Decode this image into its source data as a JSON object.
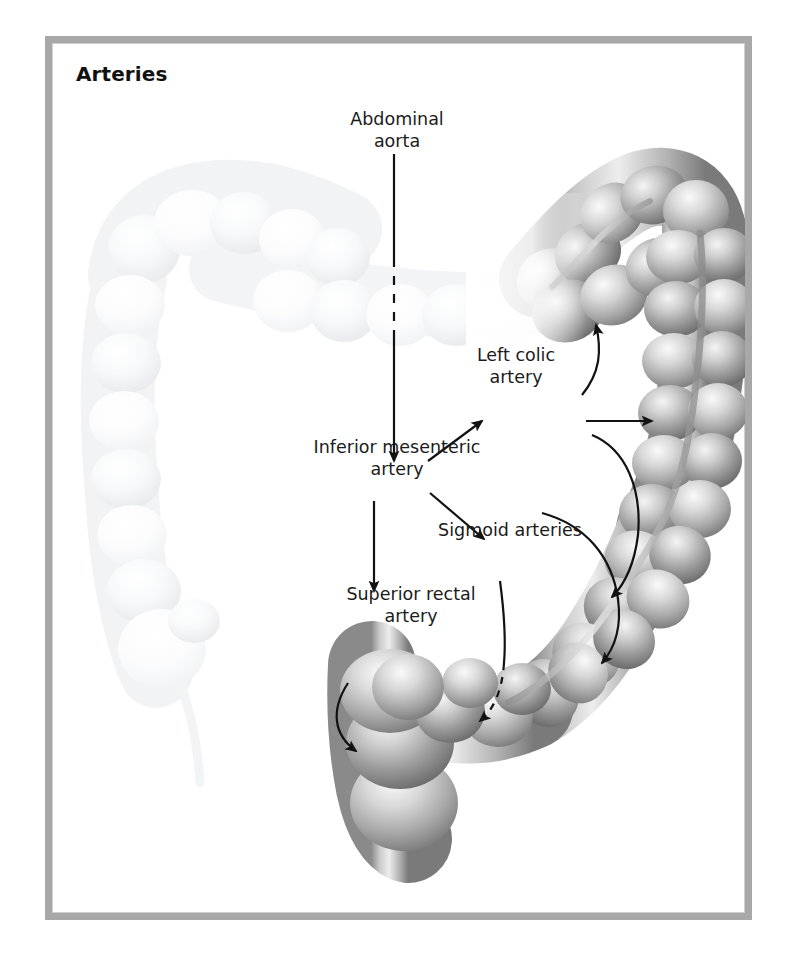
{
  "figure": {
    "title": "Arteries",
    "frame_color": "#a8a8a8",
    "background_color": "#ffffff",
    "ink_color": "#1b1b1b"
  },
  "labels": {
    "abdominal_aorta": "Abdominal\naorta",
    "inferior_mesenteric_artery": "Inferior mesenteric\nartery",
    "left_colic_artery": "Left colic\nartery",
    "sigmoid_arteries": "Sigmoid arteries",
    "superior_rectal_artery": "Superior rectal\nartery"
  },
  "anatomy": {
    "highlighted_regions": [
      "splenic flexure",
      "descending colon",
      "sigmoid colon",
      "rectum"
    ],
    "faded_regions": [
      "transverse colon",
      "hepatic flexure",
      "ascending colon",
      "cecum",
      "appendix"
    ],
    "shading": {
      "highlight": "#f2f2f2",
      "midtone": "#9a9a9a",
      "shadow": "#6d6d6d",
      "faded": "#f6f7f8"
    }
  },
  "connectors": [
    {
      "name": "aorta-to-imа-stem",
      "from": "abdominal_aorta",
      "to": "inferior_mesenteric_artery",
      "style": "straight-dashed-midsection",
      "arrowhead": true
    },
    {
      "name": "ima-to-left-colic",
      "from": "inferior_mesenteric_artery",
      "to": "left_colic_artery",
      "style": "straight-diagonal",
      "arrowhead": true
    },
    {
      "name": "ima-to-sigmoid",
      "from": "inferior_mesenteric_artery",
      "to": "sigmoid_arteries",
      "style": "straight-diagonal",
      "arrowhead": true
    },
    {
      "name": "ima-to-superior-rectal",
      "from": "inferior_mesenteric_artery",
      "to": "superior_rectal_artery",
      "style": "straight-vertical",
      "arrowhead": true
    },
    {
      "name": "left-colic-to-splenic-flexure",
      "from": "left_colic_artery",
      "to": "splenic flexure",
      "style": "curved",
      "arrowhead": true
    },
    {
      "name": "left-colic-to-descending-colon",
      "from": "left_colic_artery",
      "to": "descending colon",
      "style": "straight-horizontal",
      "arrowhead": true
    },
    {
      "name": "sigmoid-upper-branch",
      "from": "sigmoid_arteries",
      "to": "sigmoid colon upper",
      "style": "curved",
      "arrowhead": true
    },
    {
      "name": "sigmoid-lower-branch",
      "from": "sigmoid_arteries",
      "to": "sigmoid colon lower",
      "style": "curved",
      "arrowhead": true
    },
    {
      "name": "sigmoid-to-rectosigmoid-junction",
      "from": "sigmoid_arteries",
      "to": "rectosigmoid junction",
      "style": "curved-dashed-tip",
      "arrowhead": true
    },
    {
      "name": "superior-rectal-to-rectum",
      "from": "superior_rectal_artery",
      "to": "rectum",
      "style": "curved",
      "arrowhead": true
    }
  ]
}
